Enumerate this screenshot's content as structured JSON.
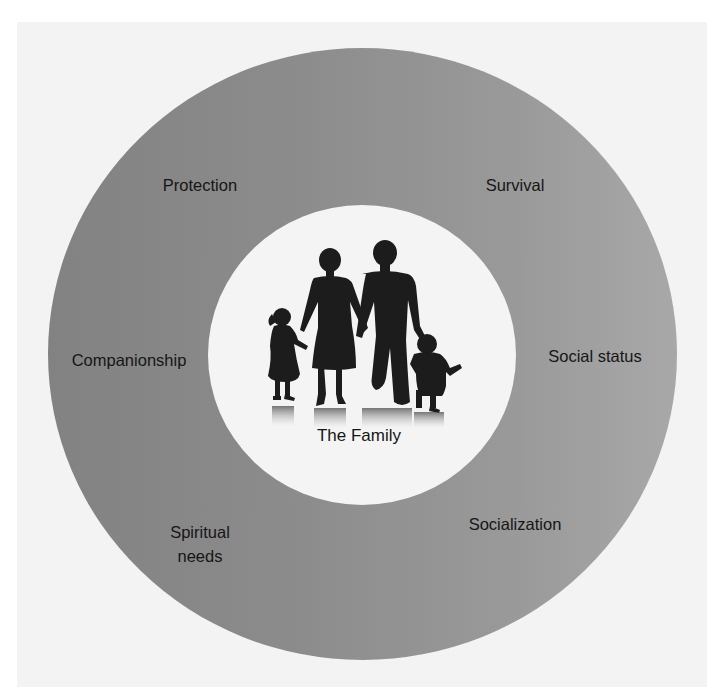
{
  "diagram": {
    "center": {
      "label": "The Family",
      "image": "family-silhouette-icon"
    },
    "ring_labels": [
      {
        "id": "protection",
        "label": "Protection"
      },
      {
        "id": "survival",
        "label": "Survival"
      },
      {
        "id": "companionship",
        "label": "Companionship"
      },
      {
        "id": "social-status",
        "label": "Social status"
      },
      {
        "id": "spiritual-needs",
        "label": "Spiritual\nneeds",
        "line1": "Spiritual",
        "line2": "needs"
      },
      {
        "id": "socialization",
        "label": "Socialization"
      }
    ],
    "colors": {
      "ring_left": "#828282",
      "ring_right": "#a8a8a8",
      "inner_fill": "#f4f4f4",
      "panel": "#f3f3f3",
      "text": "#161616",
      "silhouette": "#1c1c1c"
    }
  }
}
